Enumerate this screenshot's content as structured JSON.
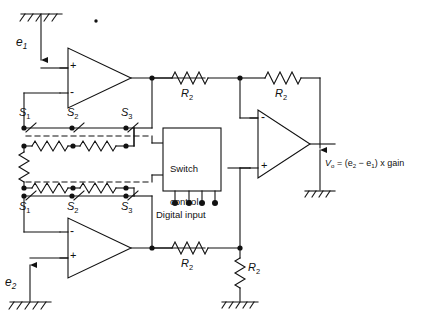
{
  "figure": {
    "type": "circuit-schematic"
  },
  "inputs": {
    "e1": {
      "label": "e",
      "sub": "1",
      "direction": "down",
      "source": "ground"
    },
    "e2": {
      "label": "e",
      "sub": "2",
      "direction": "up",
      "source": "ground"
    }
  },
  "opamps": [
    {
      "name": "top-opamp",
      "plus": "+",
      "minus": "-",
      "plus_position": "top"
    },
    {
      "name": "bottom-opamp",
      "plus": "+",
      "minus": "-",
      "plus_position": "bottom"
    },
    {
      "name": "output-opamp",
      "plus": "+",
      "minus": "-",
      "plus_position": "bottom"
    }
  ],
  "switches": {
    "top_row": [
      {
        "label": "S",
        "sub": "1"
      },
      {
        "label": "S",
        "sub": "2"
      },
      {
        "label": "S",
        "sub": "3"
      }
    ],
    "bottom_row": [
      {
        "label": "S",
        "sub": "1"
      },
      {
        "label": "S",
        "sub": "2"
      },
      {
        "label": "S",
        "sub": "3"
      }
    ]
  },
  "switch_control": {
    "line1": "Switch",
    "line2": "control",
    "digital_input_label": "Digital input",
    "digital_input_pins": 4
  },
  "resistors": [
    {
      "name": "r2-top-left",
      "label": "R",
      "sub": "2",
      "orientation": "horizontal"
    },
    {
      "name": "r2-top-right",
      "label": "R",
      "sub": "2",
      "orientation": "horizontal"
    },
    {
      "name": "r2-bottom-left",
      "label": "R",
      "sub": "2",
      "orientation": "horizontal"
    },
    {
      "name": "r2-bottom-right",
      "label": "R",
      "sub": "2",
      "orientation": "vertical"
    }
  ],
  "output": {
    "prefix": "V",
    "sub_o": "o",
    "equation_part1": " = (e",
    "sub_2": "2",
    "minus": " − e",
    "sub_1": "1",
    "equation_part2": ") x gain",
    "full": "Vo = (e2 − e1) x gain"
  },
  "grounds": [
    {
      "name": "ground-e1-top"
    },
    {
      "name": "ground-e2-bottom"
    },
    {
      "name": "ground-output"
    },
    {
      "name": "ground-r2-bottom"
    }
  ],
  "colors": {
    "line": "#111111",
    "background": "#ffffff"
  }
}
